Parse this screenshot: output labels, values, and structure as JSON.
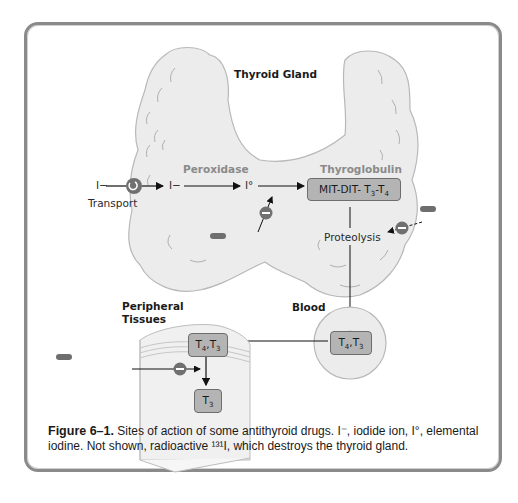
{
  "figure": {
    "title": "Thyroid Gland",
    "nodes": {
      "iodide_in": "I−",
      "transport": "Transport",
      "iodide_cell": "I−",
      "peroxidase": "Peroxidase",
      "elemental_iodine": "I°",
      "thyroglobulin": "Thyroglobulin",
      "mit_dit": "MIT-DIT- T3-T4",
      "proteolysis": "Proteolysis",
      "blood": "Blood",
      "blood_hormones": "T4,T3",
      "peripheral_tissues_line1": "Peripheral",
      "peripheral_tissues_line2": "Tissues",
      "tissue_hormones": "T4,T3",
      "tissue_t3": "T3"
    },
    "drugs": {
      "iodides_thioamides_line1": "Iodides,",
      "iodides_thioamides_line2": "thioamides",
      "iodides": "Iodides",
      "ipodate_line1": "Ipodate,",
      "ipodate_line2": "beta-blockers"
    },
    "inhibition_symbol": "−",
    "colors": {
      "gland_fill": "#ececec",
      "gland_stroke": "#b8b8b8",
      "drug_box": "#6e6e6e",
      "hormone_box": "#b4b4b4",
      "inhibitor_circle": "#707070",
      "frame": "#8a8a8a"
    }
  },
  "caption": {
    "label": "Figure 6–1.",
    "text": "Sites of action of some antithyroid drugs. I⁻, iodide ion, I°, elemental iodine. Not shown, radioactive ¹³¹I, which destroys the thyroid gland."
  }
}
